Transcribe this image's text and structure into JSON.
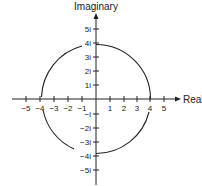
{
  "diagram": {
    "axes": {
      "imaginary_label": "Imaginary",
      "real_label": "Real"
    },
    "real_ticks": [
      {
        "value": -5,
        "label": "−5"
      },
      {
        "value": -4,
        "label": "−4"
      },
      {
        "value": -3,
        "label": "−3"
      },
      {
        "value": -2,
        "label": "−2"
      },
      {
        "value": -1,
        "label": "−1"
      },
      {
        "value": 1,
        "label": "1"
      },
      {
        "value": 2,
        "label": "2"
      },
      {
        "value": 3,
        "label": "3"
      },
      {
        "value": 4,
        "label": "4"
      },
      {
        "value": 5,
        "label": "5"
      }
    ],
    "imaginary_ticks": [
      {
        "value": 5,
        "label": "5i"
      },
      {
        "value": 4,
        "label": "4i"
      },
      {
        "value": 3,
        "label": "3i"
      },
      {
        "value": 2,
        "label": "2i"
      },
      {
        "value": 1,
        "label": "1i"
      },
      {
        "value": -1,
        "label": "−i"
      },
      {
        "value": -2,
        "label": "−2i"
      },
      {
        "value": -3,
        "label": "−3i"
      },
      {
        "value": -4,
        "label": "−4i"
      },
      {
        "value": -5,
        "label": "−5i"
      }
    ],
    "circle": {
      "center": [
        0,
        0
      ],
      "radius": 4
    },
    "colors": {
      "stroke": "#222222",
      "background": "#ffffff"
    }
  }
}
